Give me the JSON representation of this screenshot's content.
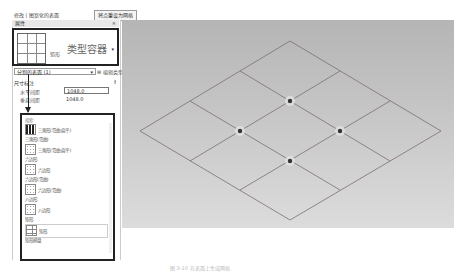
{
  "toolbar": {
    "tab_label": "修改 | 分割的表面",
    "context_label": "修改 | 图案化的表面",
    "button_label": "将点重设为网格"
  },
  "properties": {
    "title": "属性",
    "close": "×",
    "type_name": "矩形",
    "type_callout": "类型容器",
    "type_dropdown": "▾",
    "instance_selector": "分割的表面 (1)",
    "edit_type_label": "编辑类型",
    "group_label": "尺寸标注",
    "fields": [
      {
        "label": "水平间距",
        "value": "1048.0"
      },
      {
        "label": "垂直间距",
        "value": "1048.0"
      }
    ]
  },
  "pattern_list": {
    "search_placeholder": "搜索",
    "items": [
      {
        "category": "",
        "name": "三角形(弯曲-扁平)",
        "icon": "triangle-pattern-icon"
      },
      {
        "category": "三角形(弯曲)",
        "name": "三角形(弯曲-扁平)",
        "icon": "triangle-pattern-icon"
      },
      {
        "category": "六边形",
        "name": "六边形",
        "icon": "hexagon-pattern-icon"
      },
      {
        "category": "六边形(弯曲)",
        "name": "六边形(弯曲)",
        "icon": "hexagon-pattern-icon"
      },
      {
        "category": "八边形",
        "name": "八边形",
        "icon": "octagon-pattern-icon"
      },
      {
        "category": "矩形",
        "name": "矩形",
        "icon": "rectangle-pattern-icon",
        "selected": true
      },
      {
        "category": "矩形棋盘",
        "name": "",
        "icon": ""
      }
    ]
  },
  "canvas": {
    "grid": "3x3 rhombus grid",
    "nodes": 4,
    "line_color": "#7a6a6a",
    "node_color": "#333333"
  },
  "caption": "图 3-10  在表面上生成网格"
}
